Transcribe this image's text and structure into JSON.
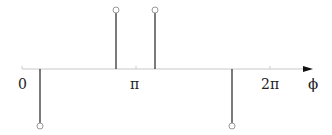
{
  "diagram": {
    "axis": {
      "y": 69,
      "x_start": 22,
      "x_end": 311,
      "label": "ϕ",
      "color": "#bbbbbb"
    },
    "ticks": [
      {
        "label": "0",
        "x": 22
      },
      {
        "label": "π",
        "x": 136
      },
      {
        "label": "2π",
        "x": 270
      }
    ],
    "stems": [
      {
        "x": 40,
        "direction": "down",
        "end_y": 126
      },
      {
        "x": 116,
        "direction": "up",
        "end_y": 10
      },
      {
        "x": 155,
        "direction": "up",
        "end_y": 10
      },
      {
        "x": 232,
        "direction": "down",
        "end_y": 126
      }
    ],
    "stem_color": "#333333",
    "marker": "open-circle"
  },
  "labels": {
    "zero": "0",
    "pi": "π",
    "two_pi": "2π",
    "phi": "ϕ"
  }
}
